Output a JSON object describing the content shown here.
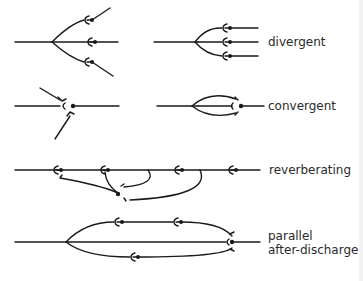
{
  "diagram": {
    "circuits": [
      {
        "id": "divergent",
        "label": "divergent",
        "variants": 2
      },
      {
        "id": "convergent",
        "label": "convergent",
        "variants": 2
      },
      {
        "id": "reverberating",
        "label": "reverberating"
      },
      {
        "id": "parallel-after-discharge",
        "label_line1": "parallel",
        "label_line2": "after-discharge"
      }
    ],
    "colors": {
      "stroke": "#1a1a1a",
      "text": "#2a2a2a",
      "background": "#ffffff"
    }
  }
}
